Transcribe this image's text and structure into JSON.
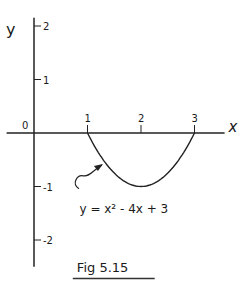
{
  "chart_data": {
    "type": "line",
    "title": "Fig 5.15",
    "xlabel": "x",
    "ylabel": "y",
    "origin_label": "0",
    "xlim": [
      -0.4,
      3.6
    ],
    "ylim": [
      -2.5,
      2.1
    ],
    "x_ticks": [
      {
        "value": 1,
        "label": "1"
      },
      {
        "value": 2,
        "label": "2"
      },
      {
        "value": 3,
        "label": "3"
      }
    ],
    "y_ticks": [
      {
        "value": 2,
        "label": "2"
      },
      {
        "value": 1,
        "label": "1"
      },
      {
        "value": -1,
        "label": "-1"
      },
      {
        "value": -2,
        "label": "-2"
      }
    ],
    "series": [
      {
        "name": "y = x² - 4x + 3",
        "function": "x^2 - 4x + 3",
        "x_range": [
          1,
          3
        ],
        "points": [
          [
            1,
            0
          ],
          [
            1.25,
            -0.4375
          ],
          [
            1.5,
            -0.75
          ],
          [
            1.75,
            -0.9375
          ],
          [
            2,
            -1
          ],
          [
            2.25,
            -0.9375
          ],
          [
            2.5,
            -0.75
          ],
          [
            2.75,
            -0.4375
          ],
          [
            3,
            0
          ]
        ]
      }
    ],
    "annotations": [
      {
        "text": "y = x² - 4x + 3",
        "points_to": "curve"
      }
    ],
    "grid": false
  }
}
